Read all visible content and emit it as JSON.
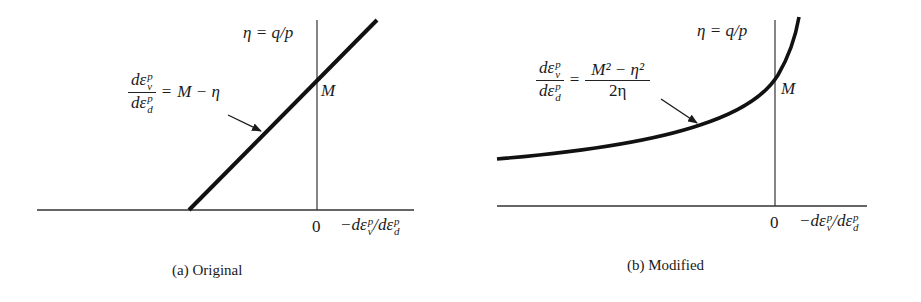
{
  "panels": [
    {
      "id": "a",
      "caption": "(a) Original",
      "y_axis_label": "η = q/p",
      "x_axis_label_prefix": "−dε",
      "x_axis_label_sep": "/dε",
      "origin_label": "0",
      "intercept_label": "M",
      "equation": {
        "numerator": "dε",
        "numerator_sup": "p",
        "numerator_sub": "v",
        "denominator": "dε",
        "denominator_sup": "p",
        "denominator_sub": "d",
        "equals": "=",
        "rhs": "M − η"
      },
      "curve_type": "linear"
    },
    {
      "id": "b",
      "caption": "(b) Modified",
      "y_axis_label": "η = q/p",
      "x_axis_label_prefix": "−dε",
      "x_axis_label_sep": "/dε",
      "origin_label": "0",
      "intercept_label": "M",
      "equation": {
        "numerator": "dε",
        "numerator_sup": "p",
        "numerator_sub": "v",
        "denominator": "dε",
        "denominator_sup": "p",
        "denominator_sub": "d",
        "equals": "=",
        "rhs_numerator": "M² − η²",
        "rhs_denominator": "2η"
      },
      "curve_type": "hyperbolic"
    }
  ],
  "sup_p": "p",
  "sub_v": "v",
  "sub_d": "d",
  "colors": {
    "ink": "#1a1a1a",
    "background": "#ffffff"
  }
}
